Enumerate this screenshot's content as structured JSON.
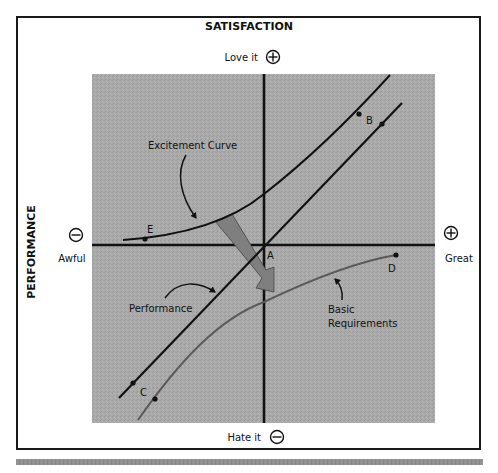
{
  "diagram": {
    "title": "SATISFACTION",
    "y_axis_label": "PERFORMANCE",
    "top_label": "Love it",
    "top_symbol": "plus-circle",
    "bottom_label": "Hate it",
    "bottom_symbol": "minus-circle",
    "left_label": "Awful",
    "left_symbol": "minus-circle",
    "right_label": "Great",
    "right_symbol": "plus-circle",
    "curves": [
      {
        "name": "Excitement Curve",
        "label": "Excitement Curve",
        "points": [
          "E",
          "B"
        ]
      },
      {
        "name": "Performance",
        "label": "Performance",
        "points": [
          "C",
          "B"
        ]
      },
      {
        "name": "Basic Requirements",
        "label_line1": "Basic",
        "label_line2": "Requirements",
        "points": [
          "C",
          "D"
        ]
      }
    ],
    "point_labels": {
      "A": "A",
      "B": "B",
      "C": "C",
      "D": "D",
      "E": "E"
    },
    "colors": {
      "plot_background": "#a8a8a8",
      "line": "#111111",
      "basic_curve": "#5a5a5a",
      "shift_arrow": "#7a7a7a",
      "frame": "#1a1a1a"
    }
  }
}
